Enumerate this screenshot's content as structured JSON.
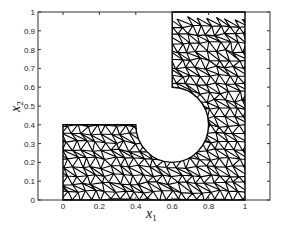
{
  "chart_data": {
    "type": "mesh",
    "title": "",
    "xlabel": "x1",
    "ylabel": "x2",
    "xlim": [
      -0.12,
      1.12
    ],
    "ylim": [
      0,
      1
    ],
    "xticks": [
      "0",
      "0.2",
      "0.4",
      "0.6",
      "0.8",
      "1"
    ],
    "yticks": [
      "0",
      "0.1",
      "0.2",
      "0.3",
      "0.4",
      "0.5",
      "0.6",
      "0.7",
      "0.8",
      "0.9",
      "1"
    ],
    "grid": false,
    "domain": {
      "description": "Triangular finite-element mesh of L-shaped region with circular cutout",
      "lower_block": {
        "x": [
          0,
          1
        ],
        "y": [
          0,
          0.4
        ]
      },
      "upper_block": {
        "x": [
          0.6,
          1
        ],
        "y": [
          0.4,
          1
        ]
      },
      "hole": {
        "center": [
          0.6,
          0.4
        ],
        "radius": 0.2
      }
    }
  },
  "labels": {
    "x_main": "x",
    "x_sub": "1",
    "y_main": "x",
    "y_sub": "2"
  }
}
